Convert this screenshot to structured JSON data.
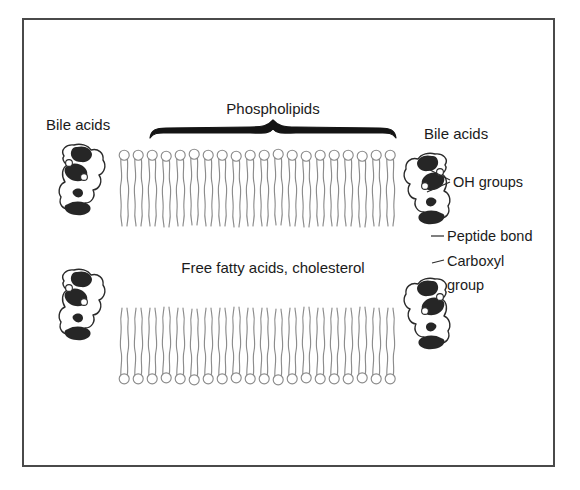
{
  "figure": {
    "background_color": "#ffffff",
    "frame": {
      "x": 22,
      "y": 18,
      "width": 533,
      "height": 449,
      "border_color": "#4a4a4a",
      "border_width": 2,
      "fill": "#ffffff"
    }
  },
  "labels": {
    "bile_acids_left": "Bile acids",
    "bile_acids_right": "Bile acids",
    "phospholipids": "Phospholipids",
    "core_contents": "Free fatty acids, cholesterol",
    "oh_groups": "OH groups",
    "peptide_bond": "Peptide bond",
    "carboxyl_group_line1": "Carboxyl",
    "carboxyl_group_line2": "group"
  },
  "colors": {
    "ink": "#1b1b1b",
    "blob_fill": "#262626",
    "outline": "#2b2b2b",
    "lipid_stroke": "#8c8c8c",
    "head_fill": "#ffffff",
    "frame": "#4a4a4a"
  },
  "structure": {
    "brace": {
      "label": "Phospholipids",
      "x_start": 150,
      "x_end": 396,
      "y": 130,
      "peak_x": 273,
      "color": "#141414"
    },
    "bilayer": {
      "upper_leaflet": {
        "head_row_y": 155,
        "tail_end_y": 232,
        "count": 20,
        "x_start": 122,
        "x_end": 388,
        "orientation": "heads-up"
      },
      "lower_leaflet": {
        "head_row_y": 377,
        "tail_end_y": 303,
        "count": 20,
        "x_start": 122,
        "x_end": 388,
        "orientation": "heads-down"
      },
      "core_label_y": 268
    },
    "bile_acid_molecules": [
      {
        "id": "left-upper",
        "x": 60,
        "y": 143,
        "flip": false
      },
      {
        "id": "left-lower",
        "x": 60,
        "y": 268,
        "flip": false
      },
      {
        "id": "right-upper",
        "x": 404,
        "y": 152,
        "flip": true
      },
      {
        "id": "right-lower",
        "x": 404,
        "y": 277,
        "flip": true
      }
    ],
    "callouts": [
      {
        "name": "oh-groups",
        "text": "OH groups",
        "text_x": 452,
        "text_y": 186,
        "leader_count": 2
      },
      {
        "name": "peptide-bond",
        "text": "Peptide bond",
        "text_x": 446,
        "text_y": 240,
        "leader_count": 1
      },
      {
        "name": "carboxyl-group",
        "text": "Carboxyl",
        "text_x": 446,
        "text_y": 266,
        "leader_count": 1
      }
    ]
  }
}
